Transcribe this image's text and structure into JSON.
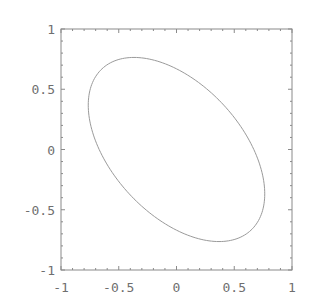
{
  "chart_data": {
    "type": "line",
    "title": "",
    "xlabel": "",
    "ylabel": "",
    "xlim": [
      -1,
      1
    ],
    "ylim": [
      -1,
      1
    ],
    "grid": false,
    "legend": null,
    "frame": true,
    "x_ticks": [
      {
        "value": -1,
        "label": "-1"
      },
      {
        "value": -0.5,
        "label": "-0.5"
      },
      {
        "value": 0,
        "label": "0"
      },
      {
        "value": 0.5,
        "label": "0.5"
      },
      {
        "value": 1,
        "label": "1"
      }
    ],
    "y_ticks": [
      {
        "value": 1,
        "label": "1"
      },
      {
        "value": 0.5,
        "label": "0.5"
      },
      {
        "value": 0,
        "label": "0"
      },
      {
        "value": -0.5,
        "label": "-0.5"
      },
      {
        "value": -1,
        "label": "-1"
      }
    ],
    "series": [
      {
        "name": "ellipse",
        "shape": "closed-curve",
        "center": [
          0,
          0
        ],
        "semi_major": 0.93,
        "semi_minor": 0.55,
        "rotation_deg": 135,
        "key_points": [
          {
            "x": -0.41,
            "y": 0.79,
            "note": "top"
          },
          {
            "x": -0.78,
            "y": 0.41,
            "note": "leftmost"
          },
          {
            "x": 0.78,
            "y": -0.37,
            "note": "rightmost"
          },
          {
            "x": 0.39,
            "y": -0.77,
            "note": "bottom"
          }
        ]
      }
    ],
    "colors": {
      "curve": "#9a9a9a",
      "frame": "#8a8a8a",
      "text": "#6f6f6f"
    }
  }
}
